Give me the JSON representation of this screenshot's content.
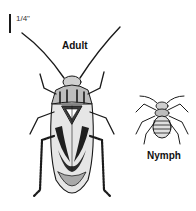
{
  "figure": {
    "scale": {
      "label": "1/4\""
    },
    "labels": {
      "adult": "Adult",
      "nymph": "Nymph"
    },
    "colors": {
      "ink": "#1a1a1a",
      "background": "#ffffff",
      "shade": "#8a8a8a",
      "light": "#d8d8d8"
    }
  }
}
